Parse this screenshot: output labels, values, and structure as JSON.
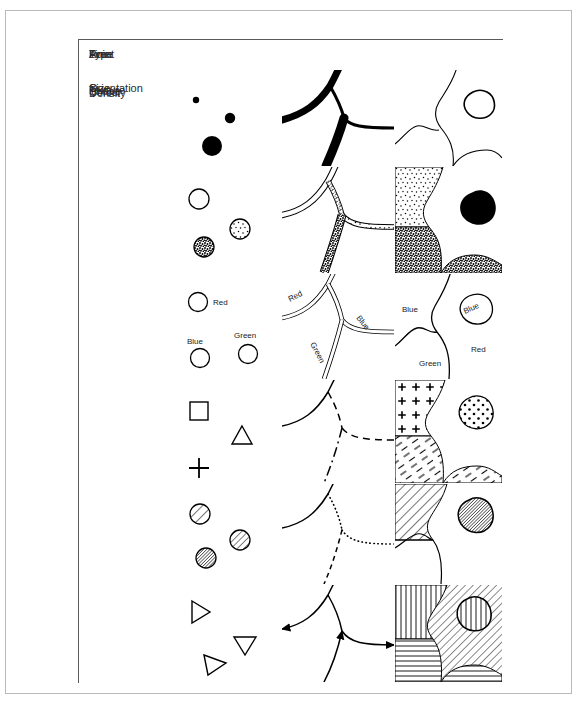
{
  "figure": {
    "background": "#ffffff",
    "frame_color": "#b9b9b9",
    "grid_color": "#5a5a5a",
    "ink_color": "#000000"
  },
  "table": {
    "columns": [
      {
        "key": "type",
        "label": "Type"
      },
      {
        "key": "point",
        "label": "Point"
      },
      {
        "key": "line",
        "label": "Line"
      },
      {
        "key": "area",
        "label": "Area"
      }
    ],
    "rows": [
      {
        "label": "Size",
        "point": "three filled circles of increasing diameter",
        "line": "roads drawn at three different line weights",
        "area": "region outlines drawn at three different line weights"
      },
      {
        "label": "Density",
        "point": "circles with no, light and dense stipple fill",
        "line": "roads with no, light and dense stipple fill",
        "area": "regions with light stipple, dense stipple and solid black fill"
      },
      {
        "label": "Colour",
        "point": "three circles labelled by colour name",
        "line": "three roads labelled by colour name",
        "area": "regions labelled by colour name",
        "point_labels": [
          "Red",
          "Blue",
          "Green"
        ],
        "line_labels": [
          "Red",
          "Blue",
          "Green"
        ],
        "area_labels": [
          "Blue",
          "Blue",
          "Red",
          "Green"
        ]
      },
      {
        "label": "Shape",
        "point": "square, triangle and plus symbols",
        "line": "solid, dashed and dash-dot lines",
        "area": "regions filled with plus signs, dashes and dots"
      },
      {
        "label": "Texture",
        "point": "circles with coarse, medium and fine hatching",
        "line": "solid, dotted and dashed lines",
        "area": "regions with coarse and fine diagonal hatching"
      },
      {
        "label": "Orientation",
        "point": "triangles rotated to different headings",
        "line": "lines carrying direction arrows",
        "area": "regions with vertical, horizontal and diagonal hatching"
      }
    ]
  }
}
